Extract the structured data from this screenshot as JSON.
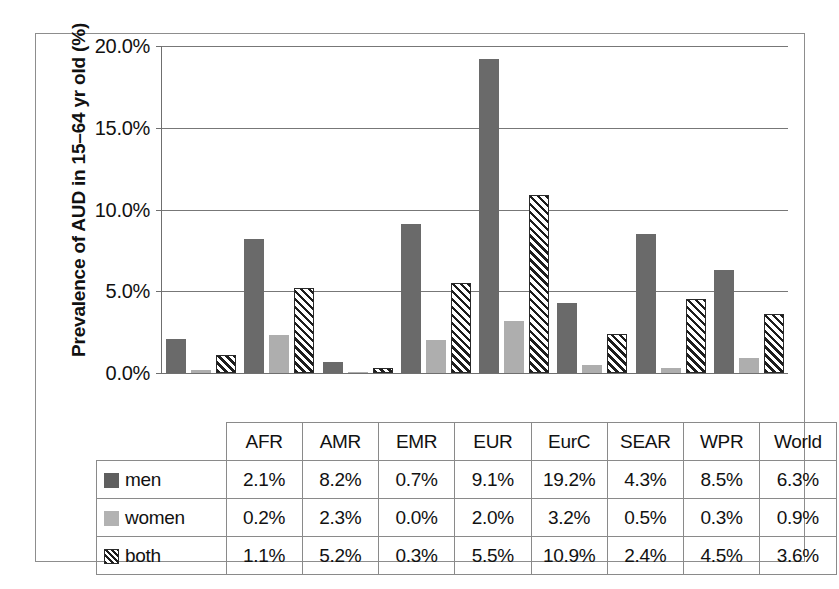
{
  "chart_data": {
    "type": "bar",
    "title": "",
    "xlabel": "",
    "ylabel": "Prevalence of AUD in 15–64 yr old (%)",
    "ylim": [
      0,
      20
    ],
    "y_ticks": [
      "0.0%",
      "5.0%",
      "10.0%",
      "15.0%",
      "20.0%"
    ],
    "y_tick_values": [
      0,
      5,
      10,
      15,
      20
    ],
    "grid": true,
    "legend_position": "table-row-labels",
    "categories": [
      "AFR",
      "AMR",
      "EMR",
      "EUR",
      "EurC",
      "SEAR",
      "WPR",
      "World"
    ],
    "series": [
      {
        "name": "men",
        "color": "#6a6a6a",
        "swatch": "men-swatch-icon",
        "values": [
          2.1,
          8.2,
          0.7,
          9.1,
          19.2,
          4.3,
          8.5,
          6.3
        ],
        "labels": [
          "2.1%",
          "8.2%",
          "0.7%",
          "9.1%",
          "19.2%",
          "4.3%",
          "8.5%",
          "6.3%"
        ]
      },
      {
        "name": "women",
        "color": "#aeaeae",
        "swatch": "women-swatch-icon",
        "values": [
          0.2,
          2.3,
          0.0,
          2.0,
          3.2,
          0.5,
          0.3,
          0.9
        ],
        "labels": [
          "0.2%",
          "2.3%",
          "0.0%",
          "2.0%",
          "3.2%",
          "0.5%",
          "0.3%",
          "0.9%"
        ]
      },
      {
        "name": "both",
        "color": "#1d1d1d",
        "swatch": "both-hatch-swatch-icon",
        "values": [
          1.1,
          5.2,
          0.3,
          5.5,
          10.9,
          2.4,
          4.5,
          3.6
        ],
        "labels": [
          "1.1%",
          "5.2%",
          "0.3%",
          "5.5%",
          "10.9%",
          "2.4%",
          "4.5%",
          "3.6%"
        ]
      }
    ]
  }
}
